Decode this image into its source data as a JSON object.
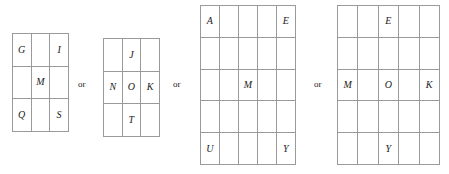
{
  "figure": {
    "separator_label": "or",
    "background_color": "#ffffff",
    "line_color": "#9a9a9a",
    "text_color": "#1b1b1b"
  },
  "separators": [
    {
      "label": "or"
    },
    {
      "label": "or"
    },
    {
      "label": "or"
    }
  ],
  "grids": [
    {
      "name": "grid-1",
      "columns": 3,
      "rows": 3,
      "cells": [
        [
          "G",
          "",
          "I"
        ],
        [
          "",
          "M",
          ""
        ],
        [
          "Q",
          "",
          "S"
        ]
      ]
    },
    {
      "name": "grid-2",
      "columns": 3,
      "rows": 3,
      "cells": [
        [
          "",
          "J",
          ""
        ],
        [
          "N",
          "O",
          "K"
        ],
        [
          "",
          "T",
          ""
        ]
      ]
    },
    {
      "name": "grid-3",
      "columns": 5,
      "rows": 5,
      "cells": [
        [
          "A",
          "",
          "",
          "",
          "E"
        ],
        [
          "",
          "",
          "",
          "",
          ""
        ],
        [
          "",
          "",
          "M",
          "",
          ""
        ],
        [
          "",
          "",
          "",
          "",
          ""
        ],
        [
          "U",
          "",
          "",
          "",
          "Y"
        ]
      ]
    },
    {
      "name": "grid-4",
      "columns": 5,
      "rows": 5,
      "cells": [
        [
          "",
          "",
          "E",
          "",
          ""
        ],
        [
          "",
          "",
          "",
          "",
          ""
        ],
        [
          "M",
          "",
          "O",
          "",
          "K"
        ],
        [
          "",
          "",
          "",
          "",
          ""
        ],
        [
          "",
          "",
          "Y",
          "",
          ""
        ]
      ]
    }
  ]
}
